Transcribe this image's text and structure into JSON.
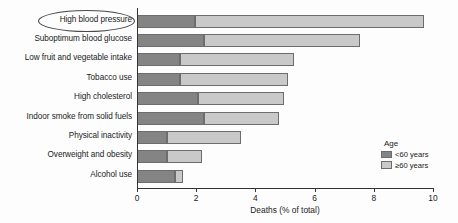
{
  "chart_data": {
    "type": "bar",
    "orientation": "horizontal",
    "stacked": true,
    "title": "",
    "xlabel": "Deaths (% of total)",
    "ylabel": "",
    "xlim": [
      0,
      10
    ],
    "xticks": [
      0,
      2,
      4,
      6,
      8,
      10
    ],
    "grid": false,
    "legend_position": "right",
    "legend_title": "Age",
    "categories": [
      "High blood pressure",
      "Suboptimum blood glucose",
      "Low fruit and vegetable intake",
      "Tobacco use",
      "High cholesterol",
      "Indoor smoke from solid fuels",
      "Physical inactivity",
      "Overweight and obesity",
      "Alcohol use"
    ],
    "series": [
      {
        "name": "<60 years",
        "color": "#848484",
        "values": [
          1.95,
          2.25,
          1.45,
          1.45,
          2.05,
          2.25,
          1.0,
          1.0,
          1.3
        ]
      },
      {
        "name": "≥60 years",
        "color": "#c9c9c9",
        "values": [
          7.75,
          5.3,
          3.85,
          3.65,
          2.9,
          2.55,
          2.5,
          1.2,
          0.25
        ]
      }
    ],
    "totals": [
      9.7,
      7.55,
      5.3,
      5.1,
      4.95,
      4.8,
      3.5,
      2.2,
      1.55
    ],
    "annotations": [
      {
        "type": "ellipse",
        "target": "High blood pressure",
        "note": "oval outline around the first category label"
      }
    ]
  },
  "legend": {
    "title": "Age",
    "entries": [
      {
        "label": "<60 years",
        "color": "#848484"
      },
      {
        "label": "≥60 years",
        "color": "#c9c9c9"
      }
    ]
  }
}
